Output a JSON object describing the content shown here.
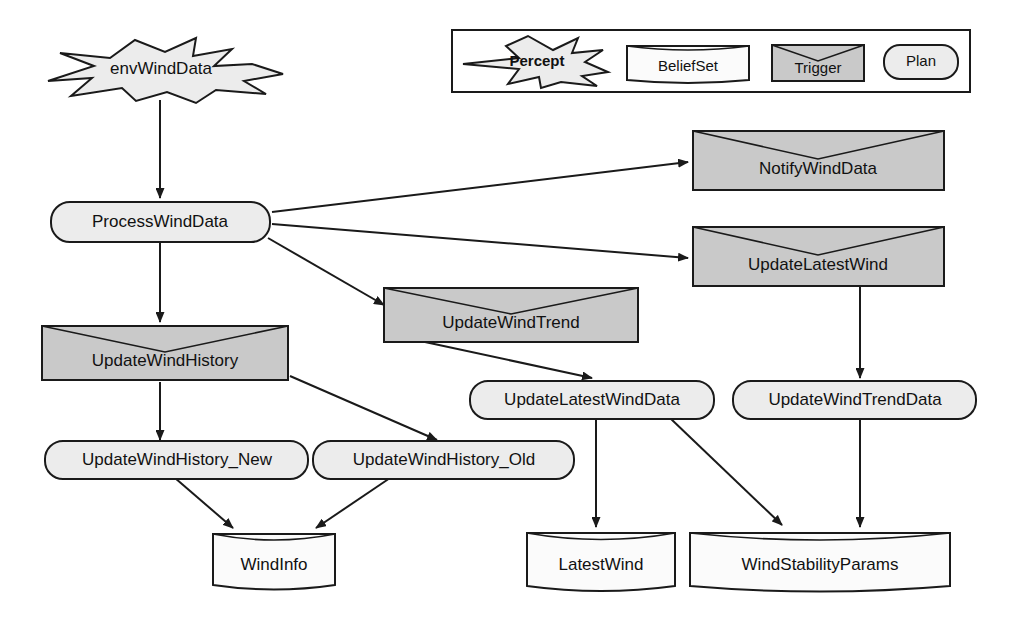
{
  "diagram": {
    "colors": {
      "percept_fill": "#ececec",
      "beliefset_fill": "#fbfbfb",
      "trigger_fill": "#c9c9c9",
      "plan_fill": "#ececec",
      "stroke": "#1a1a1a",
      "background": "#ffffff"
    },
    "legend": {
      "items": [
        {
          "label": "Percept",
          "shape": "star"
        },
        {
          "label": "BeliefSet",
          "shape": "cylinder"
        },
        {
          "label": "Trigger",
          "shape": "notched-rect"
        },
        {
          "label": "Plan",
          "shape": "rounded-rect"
        }
      ]
    },
    "nodes": [
      {
        "id": "envWindData",
        "label": "envWindData",
        "type": "percept"
      },
      {
        "id": "ProcessWindData",
        "label": "ProcessWindData",
        "type": "plan"
      },
      {
        "id": "NotifyWindData",
        "label": "NotifyWindData",
        "type": "trigger"
      },
      {
        "id": "UpdateLatestWind",
        "label": "UpdateLatestWind",
        "type": "trigger"
      },
      {
        "id": "UpdateWindTrend",
        "label": "UpdateWindTrend",
        "type": "trigger"
      },
      {
        "id": "UpdateWindHistory",
        "label": "UpdateWindHistory",
        "type": "trigger"
      },
      {
        "id": "UpdateLatestWindData",
        "label": "UpdateLatestWindData",
        "type": "plan"
      },
      {
        "id": "UpdateWindTrendData",
        "label": "UpdateWindTrendData",
        "type": "plan"
      },
      {
        "id": "UpdateWindHistory_New",
        "label": "UpdateWindHistory_New",
        "type": "plan"
      },
      {
        "id": "UpdateWindHistory_Old",
        "label": "UpdateWindHistory_Old",
        "type": "plan"
      },
      {
        "id": "WindInfo",
        "label": "WindInfo",
        "type": "beliefset"
      },
      {
        "id": "LatestWind",
        "label": "LatestWind",
        "type": "beliefset"
      },
      {
        "id": "WindStabilityParams",
        "label": "WindStabilityParams",
        "type": "beliefset"
      }
    ],
    "edges": [
      {
        "from": "envWindData",
        "to": "ProcessWindData"
      },
      {
        "from": "ProcessWindData",
        "to": "NotifyWindData"
      },
      {
        "from": "ProcessWindData",
        "to": "UpdateLatestWind"
      },
      {
        "from": "ProcessWindData",
        "to": "UpdateWindTrend"
      },
      {
        "from": "ProcessWindData",
        "to": "UpdateWindHistory"
      },
      {
        "from": "UpdateLatestWind",
        "to": "UpdateWindTrendData"
      },
      {
        "from": "UpdateWindTrend",
        "to": "UpdateLatestWindData"
      },
      {
        "from": "UpdateWindHistory",
        "to": "UpdateWindHistory_New"
      },
      {
        "from": "UpdateWindHistory",
        "to": "UpdateWindHistory_Old"
      },
      {
        "from": "UpdateWindHistory_New",
        "to": "WindInfo"
      },
      {
        "from": "UpdateWindHistory_Old",
        "to": "WindInfo"
      },
      {
        "from": "UpdateLatestWindData",
        "to": "LatestWind"
      },
      {
        "from": "UpdateLatestWindData",
        "to": "WindStabilityParams"
      },
      {
        "from": "UpdateWindTrendData",
        "to": "WindStabilityParams"
      }
    ]
  }
}
